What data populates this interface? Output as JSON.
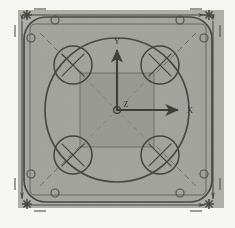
{
  "figure": {
    "kind": "engineering-drawing",
    "view": "plan-view",
    "page_background": "#fbfbfa",
    "scan_tone": "grayscale-photocopy"
  },
  "colors": {
    "page": "#fbfbfa",
    "field_fill": "#b3b3ad",
    "plate_fill": "#a9a9a3",
    "inner_square_fill": "#9d9d97",
    "line_dark": "#4a4a46",
    "line_mid": "#5f5f5a",
    "line_light": "#7d7d78",
    "dash_line": "#6e6e69",
    "axis": "#3f3f3b",
    "text": "#3a3a36"
  },
  "field": {
    "x": 18,
    "y": 10,
    "width": 206,
    "height": 198,
    "label": "drawing-field"
  },
  "plate": {
    "name": "square-plate-outline",
    "x": 24,
    "y": 17,
    "width": 188,
    "height": 185,
    "corner_radius": 22,
    "stroke_width": 1.6
  },
  "plate_inner_edge": {
    "name": "plate-inner-edge",
    "x": 30,
    "y": 24,
    "width": 176,
    "height": 171,
    "corner_radius": 6,
    "stroke_width": 1.1
  },
  "central_circle": {
    "name": "central-bore-circle",
    "cx": 117,
    "cy": 110,
    "r": 72,
    "stroke_width": 1.7
  },
  "inner_square": {
    "name": "inner-boss-square",
    "x": 80,
    "y": 73,
    "width": 74,
    "height": 74,
    "stroke_width": 1.0
  },
  "corner_holes": [
    {
      "name": "corner-hole-top-left",
      "cx": 73,
      "cy": 65,
      "r": 19
    },
    {
      "name": "corner-hole-top-right",
      "cx": 160,
      "cy": 65,
      "r": 19
    },
    {
      "name": "corner-hole-bottom-left",
      "cx": 73,
      "cy": 155,
      "r": 19
    },
    {
      "name": "corner-hole-bottom-right",
      "cx": 160,
      "cy": 155,
      "r": 19
    }
  ],
  "corner_hole_mark": "crossed-circle",
  "fastener_holes": [
    {
      "name": "fastener-hole-1",
      "cx": 31,
      "cy": 38,
      "r": 4
    },
    {
      "name": "fastener-hole-2",
      "cx": 55,
      "cy": 20,
      "r": 4
    },
    {
      "name": "fastener-hole-3",
      "cx": 180,
      "cy": 20,
      "r": 4
    },
    {
      "name": "fastener-hole-4",
      "cx": 204,
      "cy": 38,
      "r": 4
    },
    {
      "name": "fastener-hole-5",
      "cx": 204,
      "cy": 174,
      "r": 4
    },
    {
      "name": "fastener-hole-6",
      "cx": 180,
      "cy": 193,
      "r": 4
    },
    {
      "name": "fastener-hole-7",
      "cx": 55,
      "cy": 193,
      "r": 4
    },
    {
      "name": "fastener-hole-8",
      "cx": 31,
      "cy": 174,
      "r": 4
    }
  ],
  "diagonal_centerlines": [
    {
      "name": "diagonal-centerline-nw",
      "x1": 40,
      "y1": 33,
      "x2": 104,
      "y2": 97
    },
    {
      "name": "diagonal-centerline-ne",
      "x1": 196,
      "y1": 33,
      "x2": 130,
      "y2": 99
    },
    {
      "name": "diagonal-centerline-sw",
      "x1": 40,
      "y1": 186,
      "x2": 106,
      "y2": 120
    },
    {
      "name": "diagonal-centerline-se",
      "x1": 196,
      "y1": 186,
      "x2": 130,
      "y2": 120
    }
  ],
  "axis_triad": {
    "name": "coordinate-triad",
    "origin": {
      "x": 117,
      "y": 110
    },
    "axes": [
      {
        "name": "y-axis-arrow",
        "label": "Y",
        "dir": "up",
        "length": 62,
        "label_x": 117,
        "label_y": 42
      },
      {
        "name": "x-axis-arrow",
        "label": "X",
        "dir": "right",
        "length": 63,
        "label_x": 189,
        "label_y": 111
      },
      {
        "name": "z-axis-origin",
        "label": "Z",
        "dir": "out-of-plane",
        "length": 0,
        "label_x": 125,
        "label_y": 105
      }
    ]
  },
  "dimension_lines": [
    {
      "name": "overall-width-dimension-top",
      "orientation": "horizontal",
      "x1": 29,
      "y1": 15,
      "x2": 206,
      "y2": 15,
      "value": ""
    },
    {
      "name": "overall-width-dimension-bottom",
      "orientation": "horizontal",
      "x1": 29,
      "y1": 205,
      "x2": 206,
      "y2": 205,
      "value": ""
    },
    {
      "name": "overall-height-dimension-left",
      "orientation": "vertical",
      "x1": 22,
      "y1": 19,
      "x2": 22,
      "y2": 201,
      "value": ""
    },
    {
      "name": "overall-height-dimension-right",
      "orientation": "vertical",
      "x1": 213,
      "y1": 19,
      "x2": 213,
      "y2": 201,
      "value": ""
    }
  ],
  "corner_markers": [
    {
      "name": "extension-marker-top-left",
      "cx": 27,
      "cy": 15
    },
    {
      "name": "extension-marker-top-right",
      "cx": 209,
      "cy": 15
    },
    {
      "name": "extension-marker-bottom-left",
      "cx": 27,
      "cy": 204
    },
    {
      "name": "extension-marker-bottom-right",
      "cx": 209,
      "cy": 204
    }
  ],
  "corner_marker_glyph": "asterisk-star",
  "tick_marks": [
    {
      "name": "tick-top-left",
      "x1": 34,
      "y1": 9,
      "x2": 46,
      "y2": 9
    },
    {
      "name": "tick-top-right",
      "x1": 190,
      "y1": 9,
      "x2": 202,
      "y2": 9
    },
    {
      "name": "tick-bottom-left",
      "x1": 34,
      "y1": 211,
      "x2": 46,
      "y2": 211
    },
    {
      "name": "tick-bottom-right",
      "x1": 190,
      "y1": 211,
      "x2": 202,
      "y2": 211
    },
    {
      "name": "tick-left-top",
      "x1": 15,
      "y1": 25,
      "x2": 15,
      "y2": 37
    },
    {
      "name": "tick-left-bottom",
      "x1": 15,
      "y1": 178,
      "x2": 15,
      "y2": 190
    },
    {
      "name": "tick-right-top",
      "x1": 220,
      "y1": 25,
      "x2": 220,
      "y2": 37
    },
    {
      "name": "tick-right-bottom",
      "x1": 220,
      "y1": 178,
      "x2": 220,
      "y2": 190
    }
  ]
}
